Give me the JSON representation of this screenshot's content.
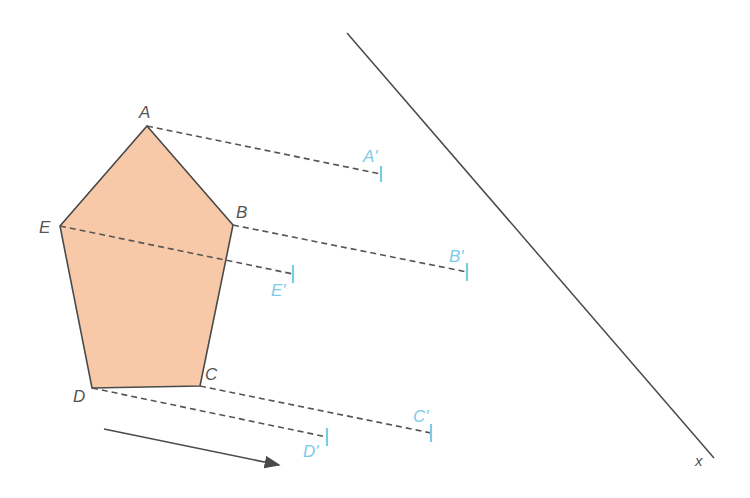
{
  "diagram": {
    "colors": {
      "fill": "#f7c9a8",
      "stroke": "#4a4a4a",
      "dash": "#555555",
      "image": "#7ccbe6"
    },
    "labels": {
      "A": "A",
      "B": "B",
      "C": "C",
      "D": "D",
      "E": "E",
      "A_prime": "A'",
      "B_prime": "B'",
      "C_prime": "C'",
      "D_prime": "D'",
      "E_prime": "E'",
      "line": "x"
    },
    "pentagon": {
      "A": [
        147,
        126
      ],
      "B": [
        233,
        225
      ],
      "C": [
        200,
        386
      ],
      "D": [
        92,
        388
      ],
      "E": [
        60,
        226
      ]
    },
    "images": {
      "A_prime": [
        381,
        174
      ],
      "B_prime": [
        467,
        272
      ],
      "C_prime": [
        431,
        433
      ],
      "D_prime": [
        327,
        437
      ],
      "E_prime": [
        293,
        274
      ]
    },
    "mirror_line": {
      "from": [
        347,
        33
      ],
      "to": [
        714,
        458
      ]
    },
    "direction_arrow": {
      "from": [
        104,
        429
      ],
      "to": [
        279,
        465
      ]
    }
  }
}
